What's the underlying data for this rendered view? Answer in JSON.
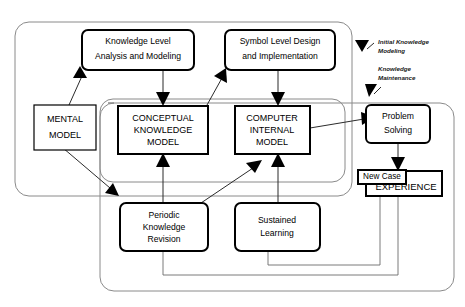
{
  "diagram": {
    "containers": [
      {
        "id": "initial-knowledge-modeling",
        "name": "Initial Knowledge Modeling"
      },
      {
        "id": "knowledge-maintenance",
        "name": "Knowledge Maintenance"
      },
      {
        "id": "outer-system",
        "name": "Overall System Boundary"
      }
    ],
    "annotations": [
      {
        "id": "anno-initial",
        "line1": "Initial Knowledge",
        "line2": "Modeling"
      },
      {
        "id": "anno-maintenance",
        "line1": "Knowledge",
        "line2": "Maintenance"
      }
    ],
    "nodes": [
      {
        "id": "knowledge-level-analysis",
        "lines": [
          "Knowledge Level",
          "Analysis and Modeling"
        ]
      },
      {
        "id": "symbol-level-design",
        "lines": [
          "Symbol Level Design",
          "and Implementation"
        ]
      },
      {
        "id": "mental-model",
        "lines": [
          "MENTAL",
          "MODEL"
        ]
      },
      {
        "id": "conceptual-knowledge-model",
        "lines": [
          "CONCEPTUAL",
          "KNOWLEDGE",
          "MODEL"
        ]
      },
      {
        "id": "computer-internal-model",
        "lines": [
          "COMPUTER",
          "INTERNAL",
          "MODEL"
        ]
      },
      {
        "id": "problem-solving",
        "lines": [
          "Problem",
          "Solving"
        ]
      },
      {
        "id": "new-case",
        "lines": [
          "New Case"
        ]
      },
      {
        "id": "experience",
        "lines": [
          "EXPERIENCE"
        ]
      },
      {
        "id": "periodic-knowledge-revision",
        "lines": [
          "Periodic",
          "Knowledge",
          "Revision"
        ]
      },
      {
        "id": "sustained-learning",
        "lines": [
          "Sustained",
          "Learning"
        ]
      }
    ],
    "edges": [
      {
        "id": "mental-to-knowledge-level",
        "from": "mental-model",
        "to": "knowledge-level-analysis"
      },
      {
        "id": "knowledge-level-to-conceptual",
        "from": "knowledge-level-analysis",
        "to": "conceptual-knowledge-model"
      },
      {
        "id": "conceptual-to-symbol-level",
        "from": "conceptual-knowledge-model",
        "to": "symbol-level-design"
      },
      {
        "id": "symbol-level-to-computer",
        "from": "symbol-level-design",
        "to": "computer-internal-model"
      },
      {
        "id": "computer-to-problem-solving",
        "from": "computer-internal-model",
        "to": "problem-solving"
      },
      {
        "id": "problem-solving-to-new-case",
        "from": "problem-solving",
        "to": "new-case"
      },
      {
        "id": "mental-to-periodic",
        "from": "mental-model",
        "to": "periodic-knowledge-revision"
      },
      {
        "id": "periodic-to-conceptual",
        "from": "periodic-knowledge-revision",
        "to": "conceptual-knowledge-model"
      },
      {
        "id": "periodic-to-computer",
        "from": "periodic-knowledge-revision",
        "to": "computer-internal-model"
      },
      {
        "id": "sustained-to-computer",
        "from": "sustained-learning",
        "to": "computer-internal-model"
      },
      {
        "id": "experience-to-periodic",
        "from": "experience",
        "to": "periodic-knowledge-revision"
      },
      {
        "id": "experience-to-sustained",
        "from": "experience",
        "to": "sustained-learning"
      }
    ],
    "colors": {
      "background": "#ffffff",
      "box_stroke": "#000000",
      "container_stroke": "#8a8a8a",
      "edge": "#2b2b2b",
      "text": "#000000"
    }
  }
}
